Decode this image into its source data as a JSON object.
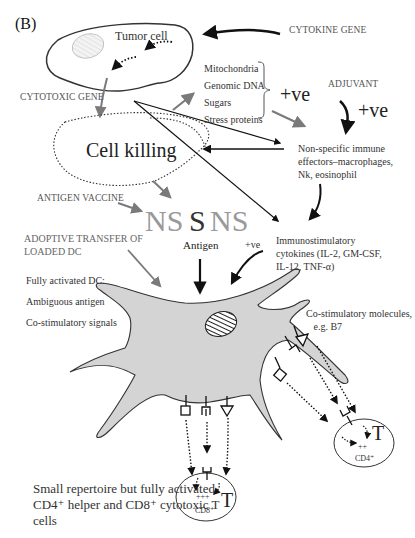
{
  "panel_label": "(B)",
  "tumor_cell_label": "Tumor cell",
  "cytokine_gene_label": "CYTOKINE GENE",
  "cytotoxic_gene_label": "CYTOTOXIC GENE",
  "cell_killing_label": "Cell killing",
  "released_components": [
    "Mitochondria",
    "Genomic DNA",
    "Sugars",
    "Stress proteins"
  ],
  "released_components_text": "Mitochondria\nGenomic DNA\nSugars\nStress proteins",
  "plus_ve_large_1": "+ve",
  "plus_ve_large_2": "+ve",
  "plus_ve_small": "+ve",
  "adjuvant_label": "ADJUVANT",
  "nonspecific_effectors_label": "Non-specific immune\neffectors–macrophages,\nNk, eosinophil",
  "antigen_vaccine_label": "ANTIGEN VACCINE",
  "antigen_letters": {
    "left": "NS",
    "center": "S",
    "right": "NS"
  },
  "antigen_label": "Antigen",
  "adoptive_transfer_label": "ADOPTIVE TRANSFER OF\nLOADED DC",
  "immunostimulatory_label": "Immunostimulatory\ncytokines (IL-2, GM-CSF,\nIL-12, TNF-α)",
  "dc_properties": [
    "Fully activated DC:",
    "Ambiguous antigen",
    "Co-stimulatory signals"
  ],
  "dc_properties_text": "Fully activated DC:\nAmbiguous antigen\nCo-stimulatory signals",
  "costimulatory_label": "Co-stimulatory molecules,\n   e.g. B7",
  "summary_text": "Small repertoire but fully activated CD4⁺ helper and CD8⁺ cytotoxic T cells",
  "t_cells": [
    {
      "id": "cd8",
      "letter": "T",
      "activation": "+++",
      "label": "CD8⁺"
    },
    {
      "id": "cd4",
      "letter": "T",
      "activation": "++",
      "label": "CD4⁺"
    }
  ],
  "colors": {
    "dc_fill": "#d4d4d4",
    "outline": "#333333",
    "gray_arrow": "#7a7a7a",
    "black_arrow": "#111111",
    "ns_text": "#9a9a9a"
  }
}
